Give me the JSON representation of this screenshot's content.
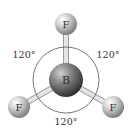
{
  "diagram": {
    "central_atom": {
      "symbol": "B",
      "x": 66,
      "y": 80,
      "r": 17
    },
    "outer_atoms": [
      {
        "symbol": "F",
        "x": 66,
        "y": 24,
        "r": 11
      },
      {
        "symbol": "F",
        "x": 19,
        "y": 107,
        "r": 11
      },
      {
        "symbol": "F",
        "x": 113,
        "y": 107,
        "r": 11
      }
    ],
    "angles": [
      {
        "label": "120°",
        "x": 24,
        "y": 58
      },
      {
        "label": "120°",
        "x": 108,
        "y": 58
      },
      {
        "label": "120°",
        "x": 66,
        "y": 125
      }
    ],
    "colors": {
      "atom_light": "#e6e6e6",
      "atom_dark": "#8a8a8a",
      "central_light": "#b5b5b5",
      "central_dark": "#3f3f3f",
      "bond": "#d8d8d8",
      "arc": "#555555"
    }
  }
}
